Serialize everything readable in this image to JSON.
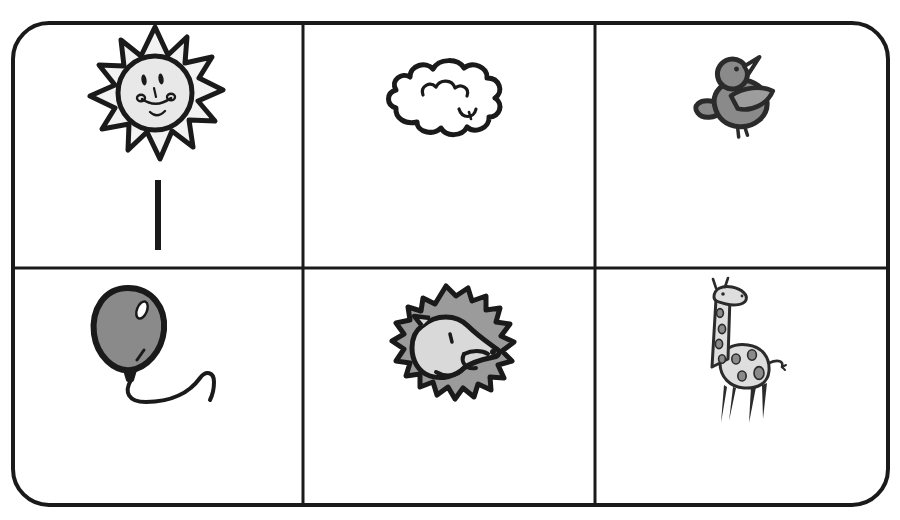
{
  "worksheet": {
    "title": "Picture Grid Worksheet",
    "background_color": "#ffffff",
    "border_color": "#1a1a1a",
    "border_width": 4,
    "corner_radius": 36,
    "frame": {
      "x": 13,
      "y": 23,
      "width": 875,
      "height": 482
    },
    "grid": {
      "rows": 2,
      "columns": 3,
      "line_color": "#1a1a1a",
      "line_width": 3,
      "vertical_dividers_x": [
        303,
        595
      ],
      "horizontal_dividers_y": [
        268
      ]
    }
  },
  "cells": [
    {
      "id": "cell-r1c1",
      "row": 1,
      "column": 1,
      "icon_name": "sun-icon",
      "label": "sun",
      "fill_color": "#e8e8e8",
      "stroke_color": "#1a1a1a",
      "tally_marks": 1
    },
    {
      "id": "cell-r1c2",
      "row": 1,
      "column": 2,
      "icon_name": "cloud-icon",
      "label": "cloud",
      "fill_color": "#ffffff",
      "stroke_color": "#1a1a1a",
      "tally_marks": 0
    },
    {
      "id": "cell-r1c3",
      "row": 1,
      "column": 3,
      "icon_name": "bird-icon",
      "label": "bird",
      "fill_color": "#8a8a8a",
      "stroke_color": "#2b2b2b",
      "tally_marks": 0
    },
    {
      "id": "cell-r2c1",
      "row": 2,
      "column": 1,
      "icon_name": "balloon-icon",
      "label": "balloon",
      "fill_color": "#8a8a8a",
      "stroke_color": "#1a1a1a",
      "tally_marks": 0
    },
    {
      "id": "cell-r2c2",
      "row": 2,
      "column": 2,
      "icon_name": "lion-icon",
      "label": "lion",
      "fill_color": "#9b9b9b",
      "face_color": "#d9d9d9",
      "stroke_color": "#1a1a1a",
      "tally_marks": 0
    },
    {
      "id": "cell-r2c3",
      "row": 2,
      "column": 3,
      "icon_name": "giraffe-icon",
      "label": "giraffe",
      "fill_color": "#dedede",
      "spot_color": "#8a8a8a",
      "stroke_color": "#2b2b2b",
      "tally_marks": 0
    }
  ],
  "tally": {
    "mark_color": "#1a1a1a",
    "mark_width": 6,
    "marks": [
      {
        "id": "tally-mark-1",
        "cell": "cell-r1c1",
        "x": 158,
        "y_top": 180,
        "y_bottom": 250
      }
    ]
  }
}
